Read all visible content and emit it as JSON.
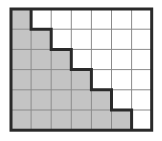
{
  "diagram": {
    "type": "staircase-grid",
    "columns": 7,
    "rows": 6,
    "shaded_counts_per_row": [
      1,
      2,
      3,
      4,
      5,
      6
    ],
    "origin": {
      "x": 11,
      "y": 9
    },
    "cell_width": 20.1,
    "cell_height": 20.2,
    "colors": {
      "shaded": "#c4c4c4",
      "unshaded": "#ffffff",
      "grid_line": "#8a8a8a",
      "border": "#2a2a2a"
    }
  }
}
